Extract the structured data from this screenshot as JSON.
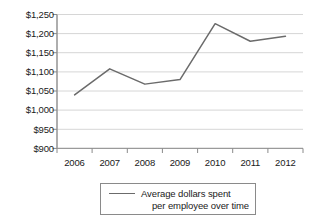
{
  "chart_data": {
    "type": "line",
    "title": "",
    "subtitle": "",
    "xlabel": "",
    "ylabel": "",
    "categories": [
      "2006",
      "2007",
      "2008",
      "2009",
      "2010",
      "2011",
      "2012"
    ],
    "series": [
      {
        "name": "Average dollars spent per employee over time",
        "values": [
          1040,
          1108,
          1068,
          1080,
          1226,
          1180,
          1193
        ]
      }
    ],
    "ylim": [
      900,
      1250
    ],
    "y_ticks": [
      900,
      950,
      1000,
      1050,
      1100,
      1150,
      1200,
      1250
    ],
    "y_tick_labels": [
      "$900",
      "$950",
      "$1,000",
      "$1,050",
      "$1,100",
      "$1,150",
      "$1,200",
      "$1,250"
    ],
    "x_tick_labels": [
      "2006",
      "2007",
      "2008",
      "2009",
      "2010",
      "2011",
      "2012"
    ],
    "grid": "horizontal",
    "legend_position": "bottom",
    "legend_entries": [
      {
        "line1": "Average dollars spent",
        "line2": "per employee over time",
        "color": "#6b6b6b"
      }
    ],
    "colors": {
      "line": "#6b6b6b",
      "axis": "#8a8a8a",
      "grid": "#d4d4d4",
      "text": "#1a1a1a",
      "background": "#ffffff"
    }
  }
}
